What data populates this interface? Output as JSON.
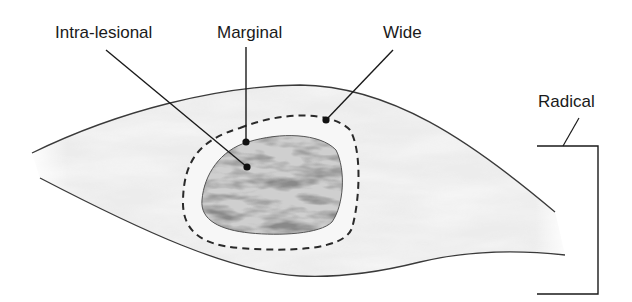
{
  "diagram": {
    "type": "surgical-margin-illustration",
    "labels": {
      "intra_lesional": "Intra-lesional",
      "marginal": "Marginal",
      "wide": "Wide",
      "radical": "Radical"
    },
    "colors": {
      "outline": "#3a3a3a",
      "leader": "#1a1a1a",
      "tissue_light": "#e6e6e6",
      "tissue_mid": "#c8c8c8",
      "lesion_dark": "#6e6e6e",
      "background": "#ffffff"
    }
  }
}
